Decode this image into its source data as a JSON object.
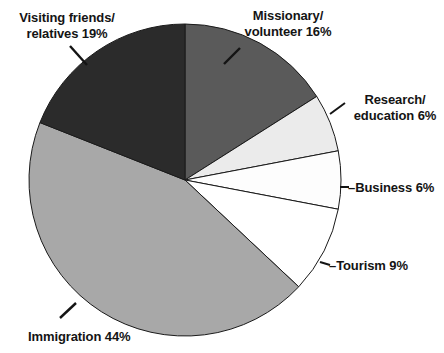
{
  "chart_data": {
    "type": "pie",
    "title": "",
    "subtitle": "",
    "xlabel": "",
    "ylabel": "",
    "grid": false,
    "legend_position": "none",
    "labels_outside": true,
    "start_angle_deg": 0,
    "direction": "clockwise",
    "categories": [
      "Missionary/ volunteer",
      "Research/ education",
      "Business",
      "Tourism",
      "Immigration",
      "Visiting friends/ relatives"
    ],
    "values": [
      16,
      6,
      6,
      9,
      44,
      19
    ],
    "units": "%",
    "slices": [
      {
        "name": "Missionary/ volunteer",
        "value": 16,
        "label": "Missionary/\nvolunteer 16%",
        "color": "#5a5a5a",
        "start_deg": 0,
        "end_deg": 57.6
      },
      {
        "name": "Research/ education",
        "value": 6,
        "label": "Research/\neducation 6%",
        "color": "#ebebeb",
        "start_deg": 57.6,
        "end_deg": 79.2
      },
      {
        "name": "Business",
        "value": 6,
        "label": "Business 6%",
        "color": "#fdfdfd",
        "start_deg": 79.2,
        "end_deg": 100.8
      },
      {
        "name": "Tourism",
        "value": 9,
        "label": "Tourism 9%",
        "color": "#ffffff",
        "start_deg": 100.8,
        "end_deg": 133.2
      },
      {
        "name": "Immigration",
        "value": 44,
        "label": "Immigration 44%",
        "color": "#a8a8a8",
        "start_deg": 133.2,
        "end_deg": 291.6
      },
      {
        "name": "Visiting friends/ relatives",
        "value": 19,
        "label": "Visiting friends/\nrelatives 19%",
        "color": "#2b2b2b",
        "start_deg": 291.6,
        "end_deg": 360
      }
    ]
  },
  "labels": {
    "visiting": "Visiting friends/\nrelatives 19%",
    "missionary": "Missionary/\nvolunteer 16%",
    "research": "Research/\neducation 6%",
    "business": "–Business 6%",
    "tourism": "–Tourism 9%",
    "immigration": "Immigration 44%"
  },
  "colors": {
    "visiting": "#2b2b2b",
    "missionary": "#5a5a5a",
    "research": "#ebebeb",
    "business": "#fdfdfd",
    "tourism": "#ffffff",
    "immigration": "#a8a8a8",
    "outline": "#1a1a1a",
    "background": "#ffffff",
    "text": "#141414"
  }
}
